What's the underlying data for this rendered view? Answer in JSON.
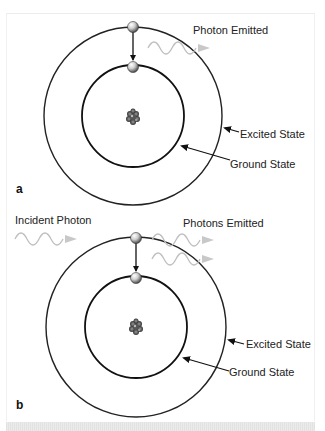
{
  "panels": [
    {
      "id": "a",
      "letter": "a",
      "labels": {
        "photon": "Photon Emitted",
        "excited": "Excited State",
        "ground": "Ground State"
      }
    },
    {
      "id": "b",
      "letter": "b",
      "labels": {
        "incident": "Incident Photon",
        "photons": "Photons Emitted",
        "excited": "Excited State",
        "ground": "Ground State"
      }
    }
  ],
  "icons": {
    "nucleus": "nucleus-icon",
    "electron": "electron-icon",
    "photon_wave": "photon-wave-icon"
  },
  "colors": {
    "orbit": "#1a1a1a",
    "photon_wave": "#bdbdbd",
    "electron_light": "#eeeeee",
    "electron_dark": "#555555",
    "text": "#222222"
  }
}
